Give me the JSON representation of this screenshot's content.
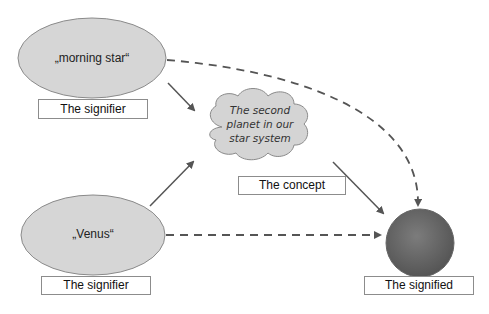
{
  "diagram": {
    "type": "semiotic-triangle",
    "nodes": {
      "signifier_top": {
        "text": "„morning star“",
        "label": "The signifier"
      },
      "signifier_bottom": {
        "text": "„Venus“",
        "label": "The signifier"
      },
      "concept": {
        "lines": [
          "The second",
          "planet in our",
          "star system"
        ],
        "label": "The concept"
      },
      "signified": {
        "icon": "planet-venus",
        "label": "The signified"
      }
    },
    "edges": [
      {
        "from": "signifier_top",
        "to": "concept",
        "style": "solid-arrow"
      },
      {
        "from": "signifier_bottom",
        "to": "concept",
        "style": "solid-arrow"
      },
      {
        "from": "concept",
        "to": "signified",
        "style": "solid-arrow"
      },
      {
        "from": "signifier_top",
        "to": "signified",
        "style": "dashed-arrow"
      },
      {
        "from": "signifier_bottom",
        "to": "signified",
        "style": "dashed-arrow"
      }
    ],
    "colors": {
      "ellipse_fill": "#d6d6d6",
      "cloud_fill": "#d4d4d4",
      "planet_fill": "#6e6e6e",
      "arrow": "#555555"
    }
  }
}
